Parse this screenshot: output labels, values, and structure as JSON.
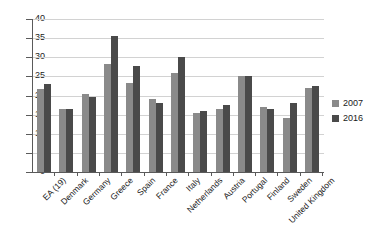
{
  "chart_data": {
    "type": "bar",
    "title": "",
    "subtitle": "",
    "xlabel": "",
    "ylabel": "",
    "ylim": [
      0,
      40
    ],
    "yticks": [
      0,
      5,
      10,
      15,
      20,
      25,
      30,
      35,
      40
    ],
    "grid": true,
    "legend_position": "right",
    "categories": [
      "EA (19)",
      "Denmark",
      "Germany",
      "Greece",
      "Spain",
      "France",
      "Italy",
      "Netherlands",
      "Austria",
      "Portugal",
      "Finland",
      "Sweden",
      "United Kingdom"
    ],
    "series": [
      {
        "name": "2007",
        "color": "#8a8a8a",
        "values": [
          21.8,
          16.5,
          20.3,
          28.2,
          23.3,
          19.0,
          26.0,
          15.5,
          16.5,
          25.0,
          17.0,
          14.0,
          22.0
        ]
      },
      {
        "name": "2016",
        "color": "#4a4a4a",
        "values": [
          23.1,
          16.4,
          19.6,
          35.5,
          27.8,
          18.1,
          30.0,
          16.0,
          17.5,
          25.0,
          16.4,
          18.0,
          22.5
        ]
      }
    ]
  },
  "legend": {
    "entries": [
      {
        "label": "2007",
        "color": "#8a8a8a"
      },
      {
        "label": "2016",
        "color": "#4a4a4a"
      }
    ]
  },
  "axis": {
    "y_min_label": "0",
    "y_max_label": "40"
  }
}
